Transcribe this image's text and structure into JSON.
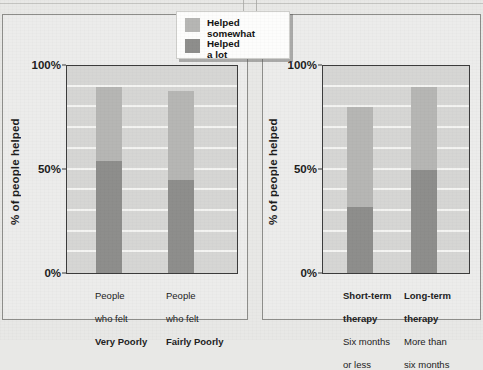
{
  "legend": {
    "entries": [
      {
        "label": "Helped\nsomewhat",
        "color": "#b6b6b4",
        "name": "helped-somewhat"
      },
      {
        "label": "Helped\na lot",
        "color": "#8e8e8c",
        "name": "helped-a-lot"
      }
    ]
  },
  "panels": [
    {
      "id": "left",
      "ylabel": "% of people helped",
      "yticks": [
        "100%",
        "50%",
        "0%"
      ]
    },
    {
      "id": "right",
      "ylabel": "% of people helped",
      "yticks": [
        "100%",
        "50%",
        "0%"
      ]
    }
  ],
  "chart_data": [
    {
      "type": "bar",
      "title": "",
      "subtype": "stacked",
      "xlabel": "",
      "ylabel": "% of people helped",
      "ylim": [
        0,
        100
      ],
      "ytick_labels": [
        "0%",
        "50%",
        "100%"
      ],
      "ytick_values": [
        0,
        50,
        100
      ],
      "grid": true,
      "grid_step": 10,
      "legend_position": "top-right",
      "categories": [
        "People\nwho felt\nVery Poorly",
        "People\nwho felt\nFairly Poorly"
      ],
      "category_lines": [
        [
          "People",
          "who felt",
          "Very Poorly"
        ],
        [
          "People",
          "who felt",
          "Fairly Poorly"
        ]
      ],
      "series": [
        {
          "name": "Helped a lot",
          "values": [
            54,
            45
          ],
          "color": "#8e8e8c"
        },
        {
          "name": "Helped somewhat",
          "values": [
            36,
            43
          ],
          "color": "#b6b6b4"
        }
      ],
      "totals": [
        90,
        88
      ]
    },
    {
      "type": "bar",
      "title": "",
      "subtype": "stacked",
      "xlabel": "",
      "ylabel": "% of people helped",
      "ylim": [
        0,
        100
      ],
      "ytick_labels": [
        "0%",
        "50%",
        "100%"
      ],
      "ytick_values": [
        0,
        50,
        100
      ],
      "grid": true,
      "grid_step": 10,
      "legend_position": "none",
      "categories": [
        "Short-term\ntherapy\nSix months\nor less",
        "Long-term\ntherapy\nMore than\nsix months"
      ],
      "category_lines": [
        [
          "Short-term",
          "therapy",
          "Six months",
          "or less"
        ],
        [
          "Long-term",
          "therapy",
          "More than",
          "six months"
        ]
      ],
      "series": [
        {
          "name": "Helped a lot",
          "values": [
            32,
            50
          ],
          "color": "#8e8e8c"
        },
        {
          "name": "Helped somewhat",
          "values": [
            48,
            40
          ],
          "color": "#b6b6b4"
        }
      ],
      "totals": [
        80,
        90
      ]
    }
  ]
}
